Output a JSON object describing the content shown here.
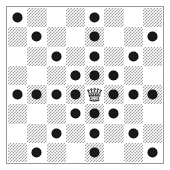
{
  "diagram": {
    "type": "chessboard",
    "board": {
      "files": 8,
      "ranks": 8,
      "light_square_color": "#ffffff",
      "dark_square_color": "#9e9e9e",
      "dark_square_fill": "hatched-halftone",
      "border_color": "#9a9a9a",
      "background_color": "#ffffff",
      "light_parity_note": "square is light when (row + col) is even"
    },
    "marker": {
      "name": "attacked-square-dot",
      "color": "#1a1a1a",
      "shape": "filled-circle",
      "count": 27
    },
    "pieces": [
      {
        "name": "white-queen",
        "glyph": "queen-icon",
        "color": "white",
        "row": 5,
        "col": 5
      }
    ],
    "attacked_squares": [
      {
        "row": 1,
        "col": 1
      },
      {
        "row": 1,
        "col": 5
      },
      {
        "row": 2,
        "col": 2
      },
      {
        "row": 2,
        "col": 5
      },
      {
        "row": 2,
        "col": 8
      },
      {
        "row": 3,
        "col": 3
      },
      {
        "row": 3,
        "col": 5
      },
      {
        "row": 3,
        "col": 7
      },
      {
        "row": 4,
        "col": 4
      },
      {
        "row": 4,
        "col": 5
      },
      {
        "row": 4,
        "col": 6
      },
      {
        "row": 5,
        "col": 1
      },
      {
        "row": 5,
        "col": 2
      },
      {
        "row": 5,
        "col": 3
      },
      {
        "row": 5,
        "col": 4
      },
      {
        "row": 5,
        "col": 6
      },
      {
        "row": 5,
        "col": 7
      },
      {
        "row": 5,
        "col": 8
      },
      {
        "row": 6,
        "col": 4
      },
      {
        "row": 6,
        "col": 5
      },
      {
        "row": 6,
        "col": 6
      },
      {
        "row": 7,
        "col": 3
      },
      {
        "row": 7,
        "col": 5
      },
      {
        "row": 7,
        "col": 7
      },
      {
        "row": 8,
        "col": 2
      },
      {
        "row": 8,
        "col": 5
      },
      {
        "row": 8,
        "col": 8
      }
    ]
  }
}
